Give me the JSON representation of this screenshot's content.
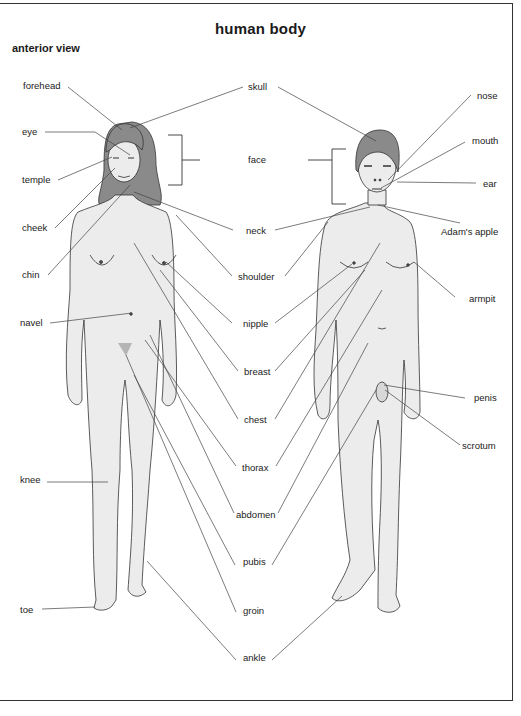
{
  "title": "human body",
  "subtitle": "anterior view",
  "labels": {
    "forehead": "forehead",
    "eye": "eye",
    "temple": "temple",
    "cheek": "cheek",
    "chin": "chin",
    "navel": "navel",
    "knee": "knee",
    "toe": "toe",
    "skull": "skull",
    "face": "face",
    "neck": "neck",
    "shoulder": "shoulder",
    "nipple": "nipple",
    "breast": "breast",
    "chest": "chest",
    "thorax": "thorax",
    "abdomen": "abdomen",
    "pubis": "pubis",
    "groin": "groin",
    "ankle": "ankle",
    "nose": "nose",
    "mouth": "mouth",
    "ear": "ear",
    "adams_apple": "Adam's apple",
    "armpit": "armpit",
    "penis": "penis",
    "scrotum": "scrotum"
  },
  "figures": {
    "left": "female figure",
    "right": "male figure"
  },
  "colors": {
    "skin": "#ececec",
    "hair": "#8a8a8a",
    "outline": "#333333",
    "leader": "#444444"
  }
}
